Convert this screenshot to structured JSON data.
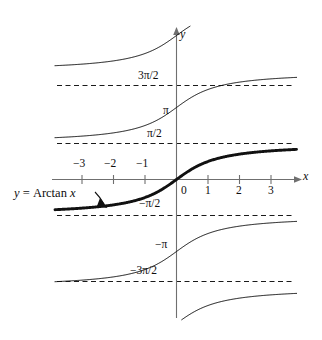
{
  "figure": {
    "axis_labels": {
      "x": "x",
      "y": "y"
    },
    "annotation": {
      "prefix": "y",
      "equals": "=",
      "func": "Arctan",
      "arg": "x",
      "full": "y = Arctan x"
    }
  },
  "chart_data": {
    "type": "line",
    "title": "",
    "subtitle": "",
    "xlabel": "x",
    "ylabel": "y",
    "xlim": [
      -3.8,
      3.8
    ],
    "ylim": [
      -6.6,
      6.6
    ],
    "grid": false,
    "legend": "none",
    "x_ticks": [
      -3,
      -2,
      -1,
      0,
      1,
      2,
      3
    ],
    "x_tick_labels": [
      "−3",
      "−2",
      "−1",
      "0",
      "1",
      "2",
      "3"
    ],
    "y_tick_labels": [
      "3π/2",
      "π",
      "π/2",
      "−π/2",
      "−π",
      "−3π/2"
    ],
    "y_tick_values": [
      4.712,
      3.142,
      1.571,
      -1.571,
      -3.142,
      -4.712
    ],
    "asymptotes": {
      "style": "dashed",
      "labels": [
        "3π/2",
        "π/2",
        "−π/2",
        "−3π/2"
      ],
      "values": [
        4.712,
        1.571,
        -1.571,
        -4.712
      ]
    },
    "series": [
      {
        "name": "Arctan x + 2π",
        "branch_k": 2,
        "offset": 6.283,
        "emphasis": "thin",
        "formula": "arctan(x) + 2π"
      },
      {
        "name": "Arctan x + π",
        "branch_k": 1,
        "offset": 3.142,
        "emphasis": "thin",
        "formula": "arctan(x) + π"
      },
      {
        "name": "Arctan x",
        "branch_k": 0,
        "offset": 0,
        "emphasis": "bold",
        "formula": "arctan(x)"
      },
      {
        "name": "Arctan x − π",
        "branch_k": -1,
        "offset": -3.142,
        "emphasis": "thin",
        "formula": "arctan(x) − π"
      },
      {
        "name": "Arctan x − 2π",
        "branch_k": -2,
        "offset": -6.283,
        "emphasis": "thin",
        "formula": "arctan(x) − 2π"
      }
    ],
    "annotations": [
      {
        "text": "y = Arctan x",
        "points_to": "principal branch",
        "x": -2.6,
        "y": -1.35
      }
    ]
  },
  "colors": {
    "curve": "#111111",
    "axis": "#6f6f6f",
    "asymptote": "#1a1a1a",
    "text": "#0d0d0d",
    "background": "#ffffff"
  }
}
